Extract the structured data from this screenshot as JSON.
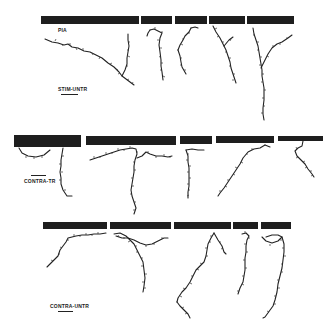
{
  "figure": {
    "rows": [
      {
        "id": "stim-untr",
        "condition_label": "STIM-UNTR",
        "surface_label": "PIA",
        "panels": 5
      },
      {
        "id": "contra-tr",
        "condition_label": "CONTRA-TR",
        "panels": 5
      },
      {
        "id": "contra-untr",
        "condition_label": "CONTRA-UNTR",
        "panels": 5
      }
    ],
    "colors": {
      "ink": "#1e1e1e",
      "background": "#ffffff"
    }
  }
}
